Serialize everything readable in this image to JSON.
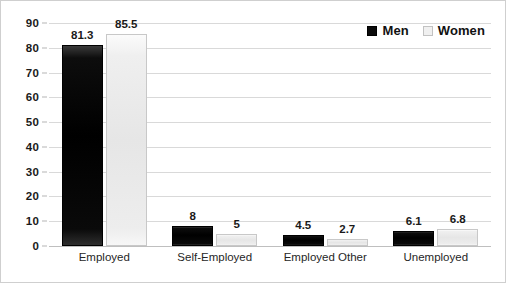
{
  "chart_data": {
    "type": "bar",
    "title": "",
    "subtitle": "",
    "xlabel": "",
    "ylabel": "",
    "categories": [
      "Employed",
      "Self-Employed",
      "Employed Other",
      "Unemployed"
    ],
    "series": [
      {
        "name": "Men",
        "color": "#000000",
        "values": [
          81.3,
          8,
          4.5,
          6.1
        ],
        "labels": [
          "81.3",
          "8",
          "4.5",
          "6.1"
        ]
      },
      {
        "name": "Women",
        "color": "#EDEDED",
        "values": [
          85.5,
          5,
          2.7,
          6.8
        ],
        "labels": [
          "85.5",
          "5",
          "2.7",
          "6.8"
        ]
      }
    ],
    "ylim": [
      0,
      90
    ],
    "yticks": [
      0,
      10,
      20,
      30,
      40,
      50,
      60,
      70,
      80,
      90
    ],
    "ytick_labels": [
      "0",
      "10",
      "20",
      "30",
      "40",
      "50",
      "60",
      "70",
      "80",
      "90"
    ],
    "grid": true,
    "grid_axis": "y",
    "grid_color": "#D9D9D9",
    "legend_position": "top-right",
    "background_color": "#FFFFFF",
    "border_color": "#CFCFCF"
  },
  "legend": {
    "entries": [
      {
        "label": "Men",
        "swatch": "black-square-icon"
      },
      {
        "label": "Women",
        "swatch": "light-square-icon"
      }
    ]
  }
}
